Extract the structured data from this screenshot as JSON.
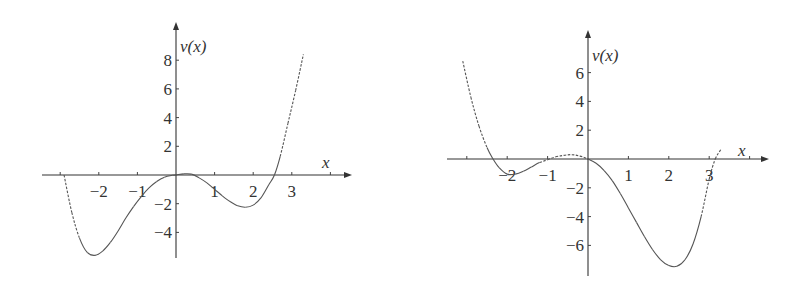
{
  "chart_data": [
    {
      "type": "line",
      "title": "",
      "xlabel": "x",
      "ylabel": "v(x)",
      "x_ticks": [
        -2,
        -1,
        1,
        2,
        3
      ],
      "y_ticks": [
        8,
        6,
        4,
        2,
        -2,
        -4
      ],
      "x_tick_labels": [
        "−2",
        "−1",
        "1",
        "2",
        "3"
      ],
      "y_tick_labels": [
        "8",
        "6",
        "4",
        "2",
        "−2",
        "−4"
      ],
      "xlim": [
        -3.5,
        4.5
      ],
      "ylim": [
        -5.9,
        10.5
      ],
      "grid": false,
      "legend": null,
      "series": [
        {
          "name": "v(x)",
          "x": [
            -2.9,
            -2.7,
            -2.5,
            -2.3,
            -2.1,
            -1.9,
            -1.7,
            -1.5,
            -1.3,
            -1.1,
            -0.9,
            -0.7,
            -0.5,
            -0.3,
            -0.1,
            0.0,
            0.2,
            0.4,
            0.6,
            0.8,
            1.0,
            1.2,
            1.4,
            1.6,
            1.8,
            2.0,
            2.2,
            2.4,
            2.55,
            2.7,
            2.9,
            3.1,
            3.3
          ],
          "y": [
            0.0,
            -2.6,
            -4.4,
            -5.4,
            -5.6,
            -5.3,
            -4.7,
            -3.9,
            -3.0,
            -2.2,
            -1.5,
            -0.9,
            -0.45,
            -0.15,
            -0.02,
            0.0,
            0.08,
            0.06,
            -0.2,
            -0.55,
            -1.0,
            -1.45,
            -1.85,
            -2.15,
            -2.25,
            -2.1,
            -1.6,
            -0.7,
            0.0,
            1.3,
            3.6,
            5.9,
            8.4
          ],
          "dashed_ranges": [
            [
              -2.9,
              -2.6
            ],
            [
              2.7,
              3.3
            ]
          ]
        }
      ]
    },
    {
      "type": "line",
      "title": "",
      "xlabel": "x",
      "ylabel": "v(x)",
      "x_ticks": [
        -2,
        -1,
        1,
        2,
        3
      ],
      "y_ticks": [
        6,
        4,
        2,
        -2,
        -4,
        -6
      ],
      "x_tick_labels": [
        "−2",
        "−1",
        "1",
        "2",
        "3"
      ],
      "y_tick_labels": [
        "6",
        "4",
        "2",
        "−2",
        "−4",
        "−6"
      ],
      "xlim": [
        -3.5,
        4.5
      ],
      "ylim": [
        -8.0,
        8.8
      ],
      "grid": false,
      "legend": null,
      "series": [
        {
          "name": "v(x)",
          "x": [
            -3.1,
            -2.9,
            -2.7,
            -2.5,
            -2.35,
            -2.2,
            -2.0,
            -1.8,
            -1.6,
            -1.4,
            -1.2,
            -1.0,
            -0.8,
            -0.6,
            -0.4,
            -0.2,
            0.0,
            0.2,
            0.4,
            0.6,
            0.8,
            1.0,
            1.2,
            1.4,
            1.6,
            1.8,
            2.0,
            2.2,
            2.4,
            2.6,
            2.8,
            3.0,
            3.15,
            3.3
          ],
          "y": [
            6.8,
            4.3,
            2.3,
            0.8,
            0.0,
            -0.6,
            -1.05,
            -1.05,
            -0.85,
            -0.55,
            -0.25,
            -0.05,
            0.15,
            0.25,
            0.3,
            0.2,
            0.0,
            -0.3,
            -0.8,
            -1.5,
            -2.4,
            -3.4,
            -4.4,
            -5.4,
            -6.3,
            -7.0,
            -7.4,
            -7.45,
            -7.0,
            -5.9,
            -4.0,
            -1.4,
            0.0,
            0.7
          ],
          "dashed_ranges": [
            [
              -3.1,
              -2.6
            ],
            [
              -1.2,
              0.0
            ],
            [
              2.9,
              3.3
            ]
          ]
        }
      ]
    }
  ],
  "plots": [
    {
      "ylabel": "v(x)",
      "xlabel": "x"
    },
    {
      "ylabel": "v(x)",
      "xlabel": "x"
    }
  ]
}
